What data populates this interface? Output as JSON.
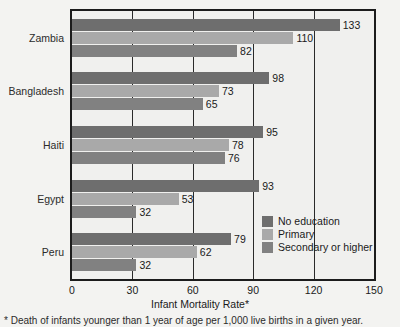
{
  "chart_data": {
    "type": "bar",
    "orientation": "horizontal",
    "title": "",
    "xlabel": "Infant Mortality Rate*",
    "ylabel": "",
    "xlim": [
      0,
      150
    ],
    "xticks": [
      "0",
      "30",
      "60",
      "90",
      "120",
      "150"
    ],
    "grid": true,
    "legend_position": "inside-bottom-right",
    "categories": [
      "Zambia",
      "Bangladesh",
      "Haiti",
      "Egypt",
      "Peru"
    ],
    "series": [
      {
        "name": "No education",
        "color": "#6e6e6e",
        "values": [
          133,
          98,
          95,
          93,
          79
        ]
      },
      {
        "name": "Primary",
        "color": "#a9a9a9",
        "values": [
          110,
          73,
          78,
          53,
          62
        ]
      },
      {
        "name": "Secondary or higher",
        "color": "#818181",
        "values": [
          82,
          65,
          76,
          32,
          32
        ]
      }
    ],
    "footnote": "* Death of infants younger than 1 year of age per 1,000 live births in a given year."
  },
  "colors": {
    "background": "#f3f3f1",
    "plot_background": "#f0f0ee",
    "axis": "#1c1c1c",
    "grid": "#2a2a2a",
    "text": "#1a1a1a"
  }
}
